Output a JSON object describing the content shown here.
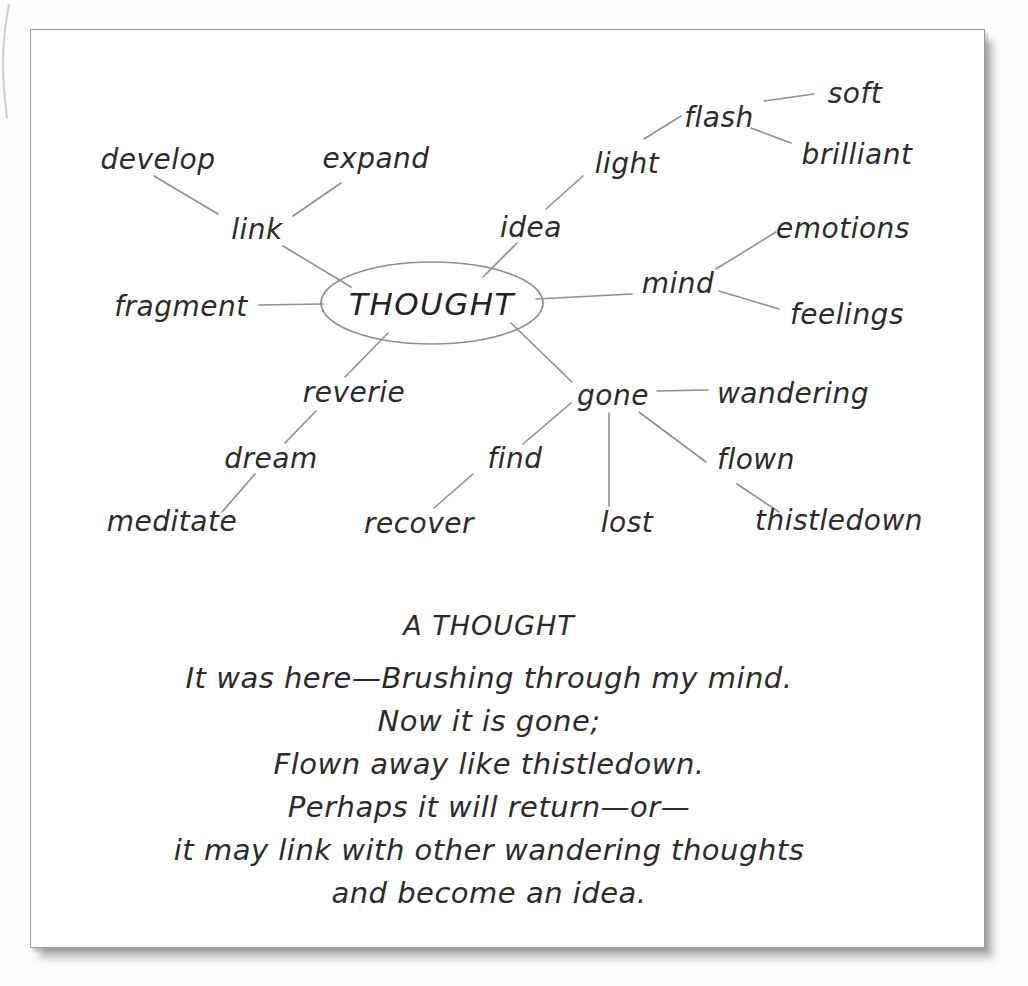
{
  "page": {
    "background": "#ffffff",
    "panel_border_color": "#9b9b9b",
    "line_color": "#8f8f8f",
    "text_color": "#2b2b2b"
  },
  "mindmap": {
    "type": "mind-map",
    "center": "THOUGHT",
    "nodes": {
      "develop": "develop",
      "expand": "expand",
      "link": "link",
      "fragment": "fragment",
      "idea": "idea",
      "light": "light",
      "flash": "flash",
      "soft": "soft",
      "brilliant": "brilliant",
      "mind": "mind",
      "emotions": "emotions",
      "feelings": "feelings",
      "reverie": "reverie",
      "dream": "dream",
      "meditate": "meditate",
      "gone": "gone",
      "wandering": "wandering",
      "find": "find",
      "recover": "recover",
      "lost": "lost",
      "flown": "flown",
      "thistledown": "thistledown"
    },
    "edges": [
      [
        "THOUGHT",
        "link"
      ],
      [
        "link",
        "develop"
      ],
      [
        "link",
        "expand"
      ],
      [
        "THOUGHT",
        "idea"
      ],
      [
        "idea",
        "light"
      ],
      [
        "light",
        "flash"
      ],
      [
        "flash",
        "soft"
      ],
      [
        "flash",
        "brilliant"
      ],
      [
        "THOUGHT",
        "mind"
      ],
      [
        "mind",
        "emotions"
      ],
      [
        "mind",
        "feelings"
      ],
      [
        "THOUGHT",
        "fragment"
      ],
      [
        "THOUGHT",
        "reverie"
      ],
      [
        "reverie",
        "dream"
      ],
      [
        "dream",
        "meditate"
      ],
      [
        "THOUGHT",
        "gone"
      ],
      [
        "gone",
        "wandering"
      ],
      [
        "gone",
        "flown"
      ],
      [
        "flown",
        "thistledown"
      ],
      [
        "gone",
        "lost"
      ],
      [
        "gone",
        "find"
      ],
      [
        "find",
        "recover"
      ]
    ]
  },
  "poem": {
    "title": "A THOUGHT",
    "lines": [
      "It was here—Brushing through my mind.",
      "Now it is gone;",
      "Flown away like thistledown.",
      "Perhaps it will return—or—",
      "it may link with other wandering thoughts",
      "and become an idea."
    ]
  }
}
